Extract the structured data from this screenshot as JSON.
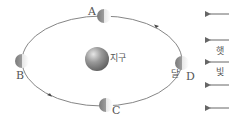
{
  "diagram": {
    "type": "moon-orbit-phases",
    "earth": {
      "label": "지구"
    },
    "moon": {
      "label": "달"
    },
    "positions": [
      {
        "id": "A",
        "label": "A"
      },
      {
        "id": "B",
        "label": "B"
      },
      {
        "id": "C",
        "label": "C"
      },
      {
        "id": "D",
        "label": "D"
      }
    ],
    "sunlight": {
      "label_top": "햇",
      "label_bottom": "빛",
      "arrow_count": 5,
      "direction": "left"
    },
    "orbit_direction": "counterclockwise",
    "colors": {
      "line": "#666666",
      "text": "#555555",
      "earth": "#8a8a8a",
      "moon": "#bdbdbd"
    }
  }
}
